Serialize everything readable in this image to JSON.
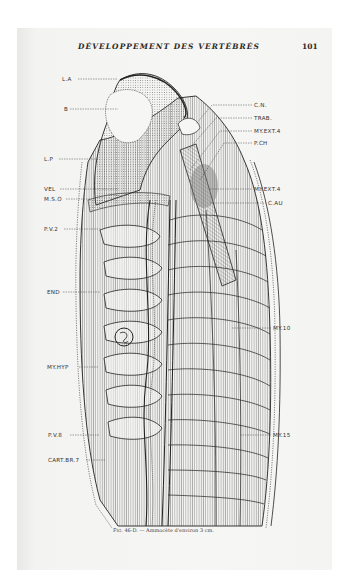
{
  "page": {
    "running_header": "DÉVELOPPEMENT DES VERTÉBRÉS",
    "page_number": "101"
  },
  "figure": {
    "caption_number": "Fig. 46-D.",
    "caption_text": "— Ammocète d'environ 3 cm.",
    "labels_left": [
      {
        "text": "L.A",
        "x": 62,
        "y": 76
      },
      {
        "text": "B",
        "x": 64,
        "y": 106
      },
      {
        "text": "L.P",
        "x": 44,
        "y": 156
      },
      {
        "text": "VEL",
        "x": 44,
        "y": 186
      },
      {
        "text": "M.S.O",
        "x": 44,
        "y": 196
      },
      {
        "text": "P.V.2",
        "x": 44,
        "y": 226
      },
      {
        "text": "END",
        "x": 47,
        "y": 289
      },
      {
        "text": "MY.HYP",
        "x": 47,
        "y": 364
      },
      {
        "text": "P.V.8",
        "x": 48,
        "y": 432
      },
      {
        "text": "CART.BR.7",
        "x": 48,
        "y": 457
      }
    ],
    "labels_right": [
      {
        "text": "C.N.",
        "x": 254,
        "y": 102
      },
      {
        "text": "TRAB.",
        "x": 254,
        "y": 115
      },
      {
        "text": "MY.EXT.4",
        "x": 254,
        "y": 128
      },
      {
        "text": "P.CH",
        "x": 254,
        "y": 140
      },
      {
        "text": "MY.EXT.4",
        "x": 254,
        "y": 186
      },
      {
        "text": "C.AU",
        "x": 268,
        "y": 200
      },
      {
        "text": "MY.10",
        "x": 273,
        "y": 325
      },
      {
        "text": "MY.15",
        "x": 273,
        "y": 432
      }
    ]
  }
}
